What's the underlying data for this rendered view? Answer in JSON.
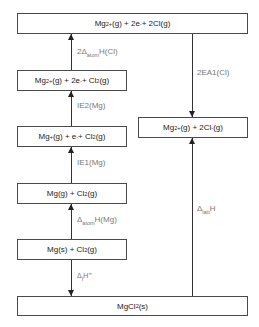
{
  "diagram": {
    "levels": [
      {
        "id": "top",
        "parts": [
          "Mg",
          "2+",
          "(g) + 2e",
          "-",
          " + 2Cl(g)"
        ]
      },
      {
        "id": "mg2plus_cl2",
        "parts": [
          "Mg",
          "2+",
          "(g) + 2e",
          "-",
          " + Cl",
          "2",
          "(g)"
        ]
      },
      {
        "id": "mgplus",
        "parts": [
          "Mg",
          "+",
          "(g) + e",
          "-",
          " + Cl",
          "2",
          "(g)"
        ]
      },
      {
        "id": "mg_gas",
        "parts": [
          "Mg(g) + Cl",
          "2",
          "(g)"
        ]
      },
      {
        "id": "mg_solid",
        "parts": [
          "Mg(s) + Cl",
          "2",
          "(g)"
        ]
      },
      {
        "id": "ions",
        "parts": [
          "Mg",
          "2+",
          "(g) + 2Cl",
          "-",
          "(g)"
        ]
      },
      {
        "id": "mgcl2",
        "parts": [
          "MgCl",
          "2",
          "(s)"
        ]
      }
    ],
    "labels": {
      "atom_cl": {
        "pre": "2Δ",
        "sub": "atom",
        "post": "H(Cl)"
      },
      "ie2": "IE2(Mg)",
      "ie1": "IE1(Mg)",
      "atom_mg": {
        "pre": "Δ",
        "sub": "atom",
        "post": "H(Mg)"
      },
      "formation": {
        "pre": "Δ",
        "sub": "f",
        "post": "H",
        "sup": "⦵"
      },
      "ea": "2EA1(Cl)",
      "lattice": {
        "pre": "Δ",
        "sub": "latt",
        "post": "H"
      }
    }
  }
}
